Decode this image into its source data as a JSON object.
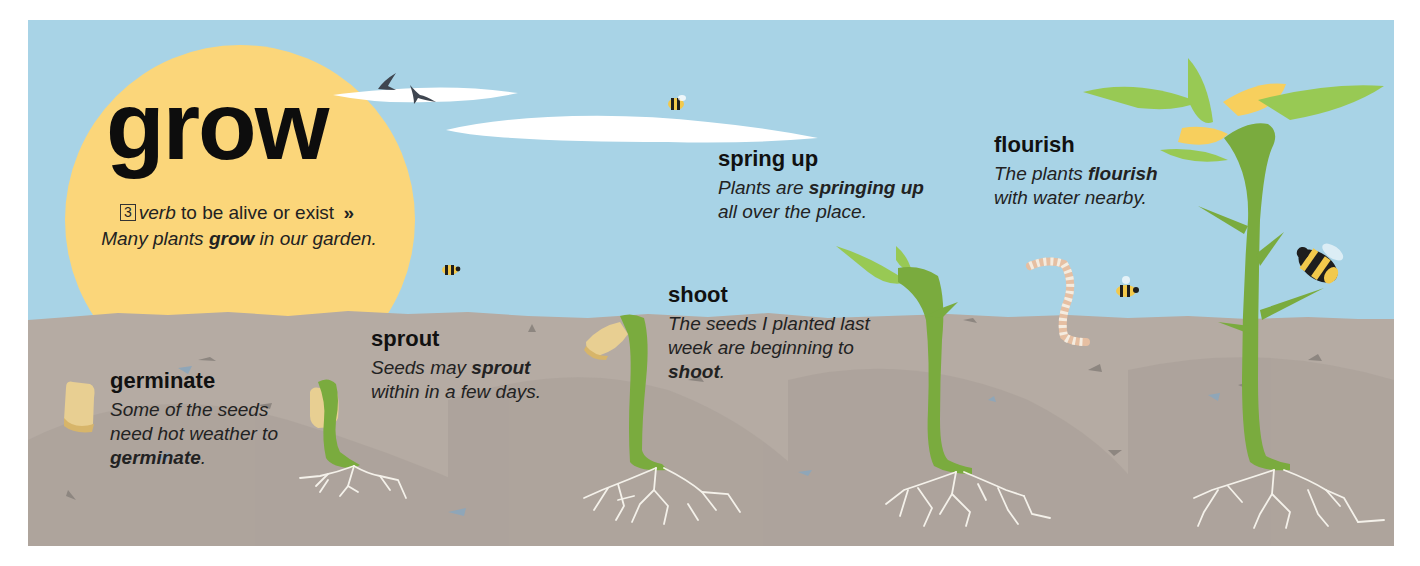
{
  "headword": "grow",
  "definition": {
    "sense_number": "3",
    "part_of_speech": "verb",
    "meaning": "to be alive or exist",
    "separator": "»",
    "example_pre": "Many plants",
    "example_bold": "grow",
    "example_post": "in our garden."
  },
  "stages": [
    {
      "term": "germinate",
      "example_pre": "Some of the seeds need hot weather to",
      "example_bold": "germinate",
      "example_post": "."
    },
    {
      "term": "sprout",
      "example_pre": "Seeds may",
      "example_bold": "sprout",
      "example_post": "within in a few days."
    },
    {
      "term": "shoot",
      "example_pre": "The seeds I planted last week are beginning to",
      "example_bold": "shoot",
      "example_post": "."
    },
    {
      "term": "spring up",
      "example_pre": "Plants are",
      "example_bold": "springing up",
      "example_post": "all over the place."
    },
    {
      "term": "flourish",
      "example_pre": "The plants",
      "example_bold": "flourish",
      "example_post": "with water nearby."
    }
  ],
  "illustration": {
    "elements": [
      "sun",
      "clouds",
      "birds",
      "bees",
      "worm",
      "seeds",
      "seedlings",
      "roots",
      "soil"
    ],
    "colors": {
      "sky": "#a8d3e6",
      "sun": "#fbd67a",
      "soil": "#b5aba3",
      "soil_shade": "#a89e97",
      "stem": "#7aab3e",
      "leaf_light": "#98c954",
      "seed": "#e8cf92",
      "roots": "#f4f1ea",
      "text": "#1a1a1a"
    }
  }
}
